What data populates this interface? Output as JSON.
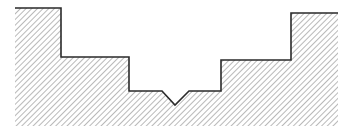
{
  "diagram": {
    "type": "cross-section-profile",
    "background": "#ffffff",
    "outline_color": "#2a2a2a",
    "hatch_color": "#8a8a8a",
    "hatch_spacing": 4,
    "hatch_angle_deg": 45,
    "profile_points": [
      [
        15,
        8
      ],
      [
        61,
        8
      ],
      [
        61,
        57
      ],
      [
        129,
        57
      ],
      [
        129,
        91
      ],
      [
        162,
        91
      ],
      [
        175,
        105
      ],
      [
        189,
        91
      ],
      [
        221,
        91
      ],
      [
        221,
        60
      ],
      [
        291,
        60
      ],
      [
        291,
        13
      ],
      [
        338,
        13
      ]
    ],
    "region_bottom": 126,
    "region_left": 15,
    "region_right": 338,
    "annotations": []
  }
}
